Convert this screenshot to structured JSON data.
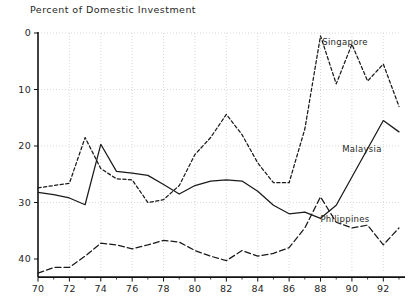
{
  "chart_data": {
    "type": "line",
    "title": "Percent of Domestic Investment",
    "xlabel": "",
    "ylabel": "",
    "xlim": [
      70,
      93
    ],
    "ylim": [
      -3,
      40
    ],
    "yticks": [
      0,
      10,
      20,
      30,
      40
    ],
    "xticks": [
      70,
      72,
      74,
      76,
      78,
      80,
      82,
      84,
      86,
      88,
      90,
      92
    ],
    "x": [
      70,
      71,
      72,
      73,
      74,
      75,
      76,
      77,
      78,
      79,
      80,
      81,
      82,
      83,
      84,
      85,
      86,
      87,
      88,
      89,
      90,
      91,
      92,
      93
    ],
    "grid": true,
    "legend_position": "inline-right",
    "series": [
      {
        "name": "Singapore",
        "style": "dashed",
        "color": "#1a1a1a",
        "values": [
          12.6,
          13.0,
          13.4,
          21.5,
          16.0,
          14.2,
          14.0,
          10.0,
          10.5,
          13.0,
          18.5,
          21.5,
          25.6,
          22.0,
          17.0,
          13.5,
          13.5,
          23.0,
          39.5,
          31.0,
          38.0,
          31.5,
          34.5,
          27.0
        ]
      },
      {
        "name": "Malaysia",
        "style": "solid",
        "color": "#1a1a1a",
        "values": [
          11.8,
          11.4,
          10.8,
          9.6,
          20.3,
          15.5,
          15.2,
          14.8,
          13.2,
          11.5,
          13.0,
          13.8,
          14.0,
          13.8,
          12.0,
          9.5,
          8.0,
          8.3,
          7.2,
          9.5,
          14.5,
          19.5,
          24.5,
          22.5
        ]
      },
      {
        "name": "Philippines",
        "style": "dash-dot",
        "color": "#1a1a1a",
        "values": [
          -2.5,
          -1.5,
          -1.5,
          0.5,
          2.8,
          2.5,
          1.8,
          2.5,
          3.3,
          3.0,
          1.5,
          0.5,
          -0.3,
          1.5,
          0.5,
          1.0,
          2.0,
          5.5,
          11.0,
          6.5,
          5.5,
          6.0,
          2.5,
          5.5
        ]
      }
    ],
    "series_label_positions": [
      {
        "name": "Singapore",
        "x": 345,
        "y": 45
      },
      {
        "name": "Malaysia",
        "x": 362,
        "y": 152
      },
      {
        "name": "Philippines",
        "x": 345,
        "y": 222
      }
    ]
  },
  "axes": {
    "y_tick_labels": [
      "40",
      "30",
      "20",
      "10",
      "0"
    ],
    "x_tick_labels": [
      "70",
      "72",
      "74",
      "76",
      "78",
      "80",
      "82",
      "84",
      "86",
      "88",
      "90",
      "92"
    ]
  },
  "colors": {
    "background": "#ffffff",
    "ink": "#1a1a1a",
    "grid": "#c9c9c9"
  }
}
